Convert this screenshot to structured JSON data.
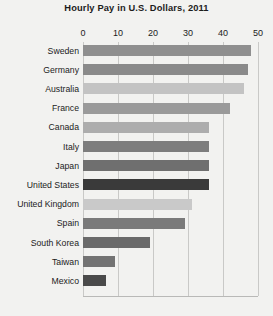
{
  "chart_data": {
    "type": "bar",
    "orientation": "horizontal",
    "title": "Hourly Pay in U.S. Dollars, 2011",
    "xlabel": "",
    "ylabel": "",
    "xlim": [
      0,
      50
    ],
    "xticks": [
      0,
      10,
      20,
      30,
      40,
      50
    ],
    "tick_labels": [
      "0",
      "10",
      "20",
      "30",
      "40",
      "50"
    ],
    "grid": true,
    "grid_axis": "x",
    "legend": "none",
    "categories": [
      "Sweden",
      "Germany",
      "Australia",
      "France",
      "Canada",
      "Italy",
      "Japan",
      "United States",
      "United Kingdom",
      "Spain",
      "South Korea",
      "Taiwan",
      "Mexico"
    ],
    "values": [
      48,
      47,
      46,
      42,
      36,
      36,
      36,
      36,
      31,
      29,
      19,
      9,
      6.5
    ],
    "bar_colors": [
      "#8f8f8f",
      "#8a8a8a",
      "#c3c3c3",
      "#9a9a9a",
      "#adadad",
      "#7d7d7d",
      "#6f6f6f",
      "#3a3a3a",
      "#c9c9c9",
      "#7a7a7a",
      "#6a6a6a",
      "#737373",
      "#4a4a4a"
    ],
    "highlight_category": "United States"
  },
  "colors": {
    "background": "#f2f2f0",
    "plot_background": "#ffffff",
    "gridline": "#c9c9c7",
    "axis_line": "#b9b9b7",
    "text": "#1c1c1c",
    "highlight_bar": "#3a3a3a"
  }
}
